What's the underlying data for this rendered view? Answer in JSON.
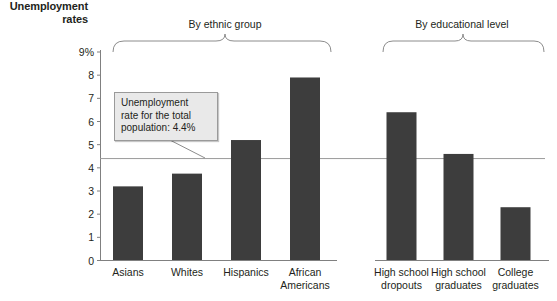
{
  "chart_data": {
    "type": "bar",
    "title": "",
    "ylabel": "Unemployment rates",
    "xlabel": "",
    "ylim": [
      0,
      9
    ],
    "grid": false,
    "legend": null,
    "categories": [
      "Asians",
      "Whites",
      "Hispanics",
      "African Americans",
      "High school dropouts",
      "High school graduates",
      "College graduates"
    ],
    "values": [
      3.2,
      3.75,
      5.2,
      7.9,
      6.4,
      4.6,
      2.3
    ],
    "ytick_labels": [
      "0",
      "1",
      "2",
      "3",
      "4",
      "5",
      "6",
      "7",
      "8",
      "9%"
    ],
    "ytick_values": [
      0,
      1,
      2,
      3,
      4,
      5,
      6,
      7,
      8,
      9
    ],
    "groups": [
      {
        "label": "By ethnic group",
        "categories": [
          "Asians",
          "Whites",
          "Hispanics",
          "African Americans"
        ]
      },
      {
        "label": "By educational level",
        "categories": [
          "High school dropouts",
          "High school graduates",
          "College graduates"
        ]
      }
    ],
    "reference_line": {
      "value": 4.4,
      "annotation": "Unemployment rate for the total population: 4.4%"
    },
    "bar_color": "#3d3d3d",
    "axis_color": "#808080",
    "reference_line_color": "#9a9a9a",
    "callout_fill": "#e9e9e9",
    "callout_border": "#9a9a9a"
  },
  "axis": {
    "y_title_line1": "Unemployment",
    "y_title_line2": "rates",
    "ticks": [
      {
        "label": "9%",
        "value": 9
      },
      {
        "label": "8",
        "value": 8
      },
      {
        "label": "7",
        "value": 7
      },
      {
        "label": "6",
        "value": 6
      },
      {
        "label": "5",
        "value": 5
      },
      {
        "label": "4",
        "value": 4
      },
      {
        "label": "3",
        "value": 3
      },
      {
        "label": "2",
        "value": 2
      },
      {
        "label": "1",
        "value": 1
      },
      {
        "label": "0",
        "value": 0
      }
    ]
  },
  "groups": {
    "ethnic": "By ethnic group",
    "education": "By educational level"
  },
  "categories": {
    "asians": "Asians",
    "whites": "Whites",
    "hispanics": "Hispanics",
    "african_americans_line1": "African",
    "african_americans_line2": "Americans",
    "hs_dropouts_line1": "High school",
    "hs_dropouts_line2": "dropouts",
    "hs_graduates_line1": "High school",
    "hs_graduates_line2": "graduates",
    "college_graduates_line1": "College",
    "college_graduates_line2": "graduates"
  },
  "callout": {
    "line1": "Unemployment",
    "line2": "rate for the total",
    "line3": "population: 4.4%"
  }
}
